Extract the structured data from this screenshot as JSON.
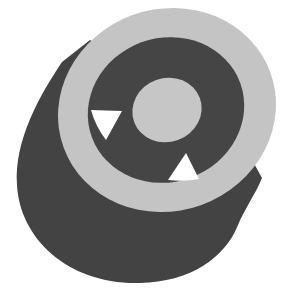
{
  "figure": {
    "colors": {
      "background": "#ffffff",
      "outer_ring_top": "#c4c4c4",
      "dark_body": "#434343",
      "inner_channel": "#454545",
      "core_top": "#c6c6c6",
      "through_hole": "#ffffff"
    }
  }
}
